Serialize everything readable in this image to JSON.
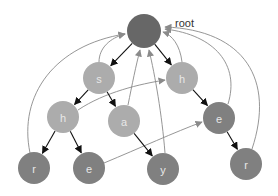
{
  "diagram": {
    "root_label": "root",
    "colors": {
      "root": "#676767",
      "dark": "#808080",
      "light": "#acacac",
      "tree_edge": "#111111",
      "suffix_link": "#8a8a8a"
    },
    "nodes": [
      {
        "id": "root",
        "label": "",
        "x": 144,
        "y": 31,
        "r": 17,
        "shade": "root"
      },
      {
        "id": "s",
        "label": "s",
        "x": 99,
        "y": 78,
        "r": 16,
        "shade": "light"
      },
      {
        "id": "h1",
        "label": "h",
        "x": 182,
        "y": 78,
        "r": 16,
        "shade": "light"
      },
      {
        "id": "h2",
        "label": "h",
        "x": 63,
        "y": 117,
        "r": 16,
        "shade": "light"
      },
      {
        "id": "a",
        "label": "a",
        "x": 124,
        "y": 121,
        "r": 16,
        "shade": "light"
      },
      {
        "id": "e1",
        "label": "e",
        "x": 219,
        "y": 118,
        "r": 16,
        "shade": "dark"
      },
      {
        "id": "r1",
        "label": "r",
        "x": 34,
        "y": 168,
        "r": 16,
        "shade": "dark"
      },
      {
        "id": "e2",
        "label": "e",
        "x": 89,
        "y": 168,
        "r": 16,
        "shade": "dark"
      },
      {
        "id": "y",
        "label": "y",
        "x": 163,
        "y": 169,
        "r": 16,
        "shade": "dark"
      },
      {
        "id": "r2",
        "label": "r",
        "x": 246,
        "y": 164,
        "r": 16,
        "shade": "dark"
      }
    ],
    "tree_edges": [
      {
        "from": "root",
        "to": "s"
      },
      {
        "from": "root",
        "to": "h1"
      },
      {
        "from": "s",
        "to": "h2"
      },
      {
        "from": "s",
        "to": "a"
      },
      {
        "from": "h1",
        "to": "e1"
      },
      {
        "from": "h2",
        "to": "r1"
      },
      {
        "from": "h2",
        "to": "e2"
      },
      {
        "from": "a",
        "to": "y"
      },
      {
        "from": "e1",
        "to": "r2"
      }
    ],
    "suffix_links": [
      {
        "from": "s",
        "to": "root"
      },
      {
        "from": "h2",
        "to": "h1"
      },
      {
        "from": "a",
        "to": "root"
      },
      {
        "from": "y",
        "to": "root"
      },
      {
        "from": "h1",
        "to": "root"
      },
      {
        "from": "e2",
        "to": "e1"
      },
      {
        "from": "e1",
        "to": "root"
      },
      {
        "from": "r1",
        "to": "root"
      },
      {
        "from": "r2",
        "to": "root"
      }
    ]
  }
}
